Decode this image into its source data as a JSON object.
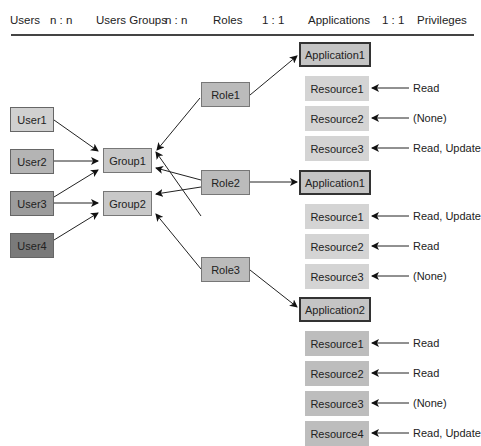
{
  "header": {
    "columns": [
      {
        "label": "Users",
        "x": 10
      },
      {
        "label": "n : n",
        "x": 50
      },
      {
        "label": "Users Groups",
        "x": 96
      },
      {
        "label": "n : n",
        "x": 165
      },
      {
        "label": "Roles",
        "x": 213
      },
      {
        "label": "1 : 1",
        "x": 262
      },
      {
        "label": "Applications",
        "x": 308
      },
      {
        "label": "1 : 1",
        "x": 382
      },
      {
        "label": "Privileges",
        "x": 417
      }
    ]
  },
  "users": [
    {
      "label": "User1",
      "color": "#d0d0d0"
    },
    {
      "label": "User2",
      "color": "#b4b4b4"
    },
    {
      "label": "User3",
      "color": "#9c9c9c"
    },
    {
      "label": "User4",
      "color": "#7a7a7a"
    }
  ],
  "groups": [
    {
      "label": "Group1"
    },
    {
      "label": "Group2"
    }
  ],
  "roles": [
    {
      "label": "Role1"
    },
    {
      "label": "Role2"
    },
    {
      "label": "Role3"
    }
  ],
  "applications": [
    {
      "label": "Application1",
      "resources": [
        {
          "label": "Resource1",
          "privilege": "Read"
        },
        {
          "label": "Resource2",
          "privilege": "(None)"
        },
        {
          "label": "Resource3",
          "privilege": "Read, Update"
        }
      ]
    },
    {
      "label": "Application1",
      "resources": [
        {
          "label": "Resource1",
          "privilege": "Read, Update"
        },
        {
          "label": "Resource2",
          "privilege": "Read"
        },
        {
          "label": "Resource3",
          "privilege": "(None)"
        }
      ]
    },
    {
      "label": "Application2",
      "resources": [
        {
          "label": "Resource1",
          "privilege": "Read"
        },
        {
          "label": "Resource2",
          "privilege": "Read"
        },
        {
          "label": "Resource3",
          "privilege": "(None)"
        },
        {
          "label": "Resource4",
          "privilege": "Read, Update"
        }
      ]
    }
  ]
}
